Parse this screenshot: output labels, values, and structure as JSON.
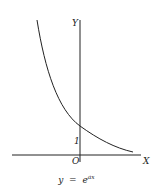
{
  "diagram": {
    "type": "function-graph",
    "curve": "exponential decay",
    "axes": {
      "x_label": "X",
      "y_label": "Y",
      "origin_label": "O"
    },
    "y_intercept_label": "1",
    "formula": {
      "base": "y  =  e",
      "exponent": "ax"
    }
  },
  "colors": {
    "line": "#222222",
    "background": "#ffffff"
  }
}
